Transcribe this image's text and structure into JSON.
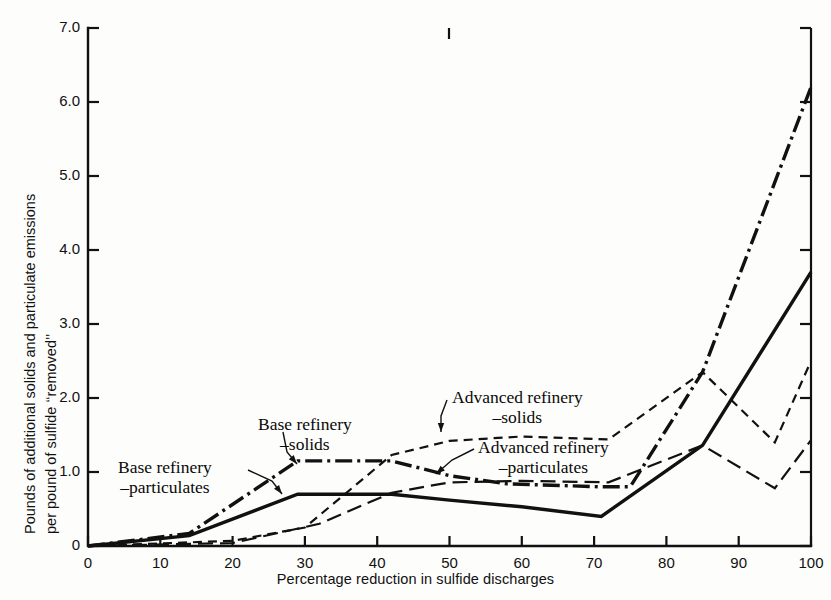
{
  "chart_data": {
    "type": "line",
    "title": "",
    "xlabel": "Percentage reduction in sulfide discharges",
    "ylabel": "Pounds of additional solids and particulate emissions per pound of sulfide \"removed\"",
    "ylabel_line1": "Pounds of additional solids and particulate emissions",
    "ylabel_line2": "per pound of sulfide ‘‘removed’’",
    "xlim": [
      0,
      100
    ],
    "ylim": [
      0,
      7.0
    ],
    "grid": false,
    "legend_position": "inline-annotations",
    "xticks": [
      0,
      10,
      20,
      30,
      40,
      50,
      60,
      70,
      80,
      90,
      100
    ],
    "xtick_labels": [
      "0",
      "10",
      "20",
      "30",
      "40",
      "50",
      "60",
      "70",
      "80",
      "90",
      "100"
    ],
    "yticks": [
      0,
      1.0,
      2.0,
      3.0,
      4.0,
      5.0,
      6.0,
      7.0
    ],
    "ytick_labels": [
      "0",
      "1.0",
      "2.0",
      "3.0",
      "4.0",
      "5.0",
      "6.0",
      "7.0"
    ],
    "series": [
      {
        "name": "Base refinery –solids",
        "key": "base_solids",
        "style": "dash-dot",
        "color": "#111111",
        "width": 3.4,
        "points": [
          [
            0,
            0.0
          ],
          [
            14,
            0.17
          ],
          [
            29,
            1.15
          ],
          [
            42,
            1.15
          ],
          [
            50,
            0.95
          ],
          [
            58,
            0.84
          ],
          [
            71,
            0.8
          ],
          [
            75,
            0.8
          ],
          [
            85,
            2.35
          ],
          [
            100,
            6.2
          ]
        ]
      },
      {
        "name": "Base refinery –particulates",
        "key": "base_particulates",
        "style": "solid",
        "color": "#111111",
        "width": 3.4,
        "points": [
          [
            0,
            0.0
          ],
          [
            14,
            0.14
          ],
          [
            29,
            0.7
          ],
          [
            42,
            0.7
          ],
          [
            50,
            0.62
          ],
          [
            60,
            0.53
          ],
          [
            71,
            0.4
          ],
          [
            85,
            1.36
          ],
          [
            100,
            3.7
          ]
        ]
      },
      {
        "name": "Advanced refinery –solids",
        "key": "advanced_solids",
        "style": "dashed",
        "color": "#111111",
        "width": 2.2,
        "points": [
          [
            0,
            0.0
          ],
          [
            20,
            0.07
          ],
          [
            30,
            0.25
          ],
          [
            42,
            1.23
          ],
          [
            50,
            1.42
          ],
          [
            60,
            1.48
          ],
          [
            72,
            1.44
          ],
          [
            85,
            2.35
          ],
          [
            95,
            1.4
          ],
          [
            100,
            2.5
          ]
        ]
      },
      {
        "name": "Advanced refinery –particulates",
        "key": "advanced_particulates",
        "style": "long-dash",
        "color": "#111111",
        "width": 2.2,
        "points": [
          [
            0,
            0.0
          ],
          [
            20,
            0.04
          ],
          [
            32,
            0.3
          ],
          [
            42,
            0.72
          ],
          [
            50,
            0.86
          ],
          [
            60,
            0.88
          ],
          [
            72,
            0.86
          ],
          [
            85,
            1.36
          ],
          [
            95,
            0.78
          ],
          [
            100,
            1.43
          ]
        ]
      }
    ],
    "annotations": [
      {
        "key": "base_particulates_label",
        "line1": "Base refinery",
        "line2": "–particulates",
        "x_px": 118,
        "y_px": 458,
        "leader": [
          [
            248,
            470
          ],
          [
            272,
            481
          ],
          [
            282,
            494
          ]
        ],
        "arrow_at": [
          282,
          494
        ]
      },
      {
        "key": "base_solids_label",
        "line1": "Base refinery",
        "line2": "–solids",
        "x_px": 258,
        "y_px": 415,
        "leader": [
          [
            283,
            432
          ],
          [
            287,
            452
          ],
          [
            297,
            464
          ]
        ],
        "arrow_at": [
          297,
          464
        ]
      },
      {
        "key": "advanced_solids_label",
        "line1": "Advanced refinery",
        "line2": "–solids",
        "x_px": 452,
        "y_px": 388,
        "leader": [
          [
            447,
            400
          ],
          [
            441,
            416
          ],
          [
            441,
            432
          ]
        ],
        "arrow_at": [
          441,
          432
        ]
      },
      {
        "key": "advanced_particulates_label",
        "line1": "Advanced refinery",
        "line2": "–particulates",
        "x_px": 478,
        "y_px": 438,
        "leader": [
          [
            474,
            449
          ],
          [
            452,
            460
          ],
          [
            436,
            474
          ]
        ],
        "arrow_at": [
          436,
          474
        ]
      }
    ]
  },
  "axes": {
    "x_title": "Percentage reduction in sulfide discharges",
    "y_title_line1": "Pounds of additional solids and particulate emissions",
    "y_title_line2": "per pound of sulfide ‘‘removed’’"
  },
  "ticks": {
    "y": [
      "7.0",
      "6.0",
      "5.0",
      "4.0",
      "3.0",
      "2.0",
      "1.0",
      "0"
    ],
    "x": [
      "0",
      "10",
      "20",
      "30",
      "40",
      "50",
      "60",
      "70",
      "80",
      "90",
      "100"
    ]
  },
  "colors": {
    "ink": "#111111",
    "background": "#fdfdfb"
  }
}
